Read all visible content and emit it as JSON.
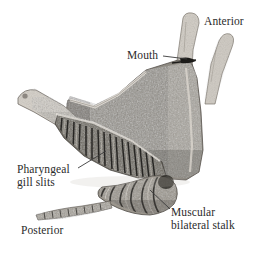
{
  "figure": {
    "type": "scientific-specimen-photograph",
    "background_color": "#ffffff",
    "text_color": "#2b2b2b",
    "leader_line_color": "#3a3a3a",
    "width": 264,
    "height": 253
  },
  "labels": {
    "anterior": {
      "text": "Anterior",
      "has_leader": false
    },
    "mouth": {
      "text": "Mouth",
      "has_leader": true
    },
    "pharyngeal": {
      "line1": "Pharyngeal",
      "line2": "gill slits",
      "has_leader": true
    },
    "posterior": {
      "text": "Posterior",
      "has_leader": false
    },
    "muscular": {
      "line1": "Muscular",
      "line2": "bilateral stalk",
      "has_leader": true
    }
  }
}
